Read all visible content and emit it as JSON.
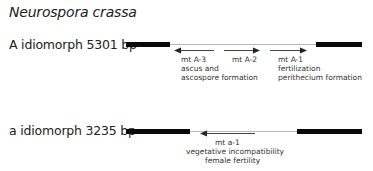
{
  "title": "Neurospora crassa",
  "idiomorphs": [
    {
      "label": "A idiomorph 5301 bp",
      "genes": [
        {
          "name": "mt A-3",
          "direction": "left",
          "functions": [
            "ascus and",
            "ascospore formation"
          ]
        },
        {
          "name": "mt A-2",
          "direction": "right",
          "functions": []
        },
        {
          "name": "mt A-1",
          "direction": "right",
          "functions": [
            "fertilization",
            "perithecium formation"
          ]
        }
      ]
    },
    {
      "label": "a idiomorph 3235 bp",
      "genes": [
        {
          "name": "mt a-1",
          "direction": "left",
          "functions": [
            "vegetative incompatibility",
            "female fertility"
          ]
        }
      ]
    }
  ],
  "colors": {
    "flank": "#0a0a0a",
    "idiomorph_line": "#b8b8b8",
    "arrow": "#444444"
  }
}
